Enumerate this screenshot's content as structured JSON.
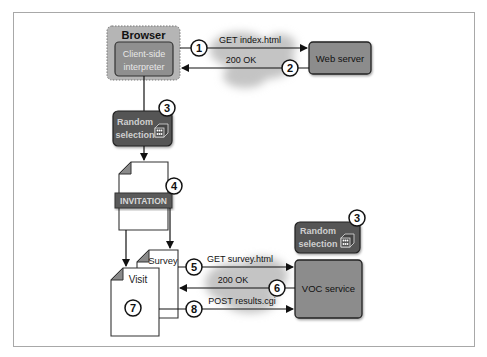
{
  "diagram": {
    "browser": {
      "title": "Browser",
      "interpreter_line1": "Client-side",
      "interpreter_line2": "interpreter"
    },
    "web_server": {
      "label": "Web server"
    },
    "voc_service": {
      "label": "VOC service"
    },
    "random_selection_top": {
      "line1": "Random",
      "line2": "selection",
      "badge": "3"
    },
    "random_selection_right": {
      "line1": "Random",
      "line2": "selection",
      "badge": "3"
    },
    "invitation": {
      "label": "INVITATION",
      "badge": "4"
    },
    "survey_doc": {
      "label": "Survey"
    },
    "visit_doc": {
      "label": "Visit",
      "badge": "7"
    },
    "arrows": [
      {
        "badge": "1",
        "label": "GET index.html"
      },
      {
        "badge": "2",
        "label": "200 OK"
      },
      {
        "badge": "5",
        "label": "GET survey.html"
      },
      {
        "badge": "6",
        "label": "200 OK"
      },
      {
        "badge": "8",
        "label": "POST results.cgi"
      }
    ],
    "colors": {
      "browser_fill": "#b5b5b5",
      "interpreter_fill": "#8f8f8f",
      "server_fill": "#8c8c8c",
      "random_fill": "#555555",
      "invitation_fill": "#5a5a5a",
      "cloud_fill": "#c4c4c4",
      "doc_corner": "#8a8a8a"
    }
  }
}
